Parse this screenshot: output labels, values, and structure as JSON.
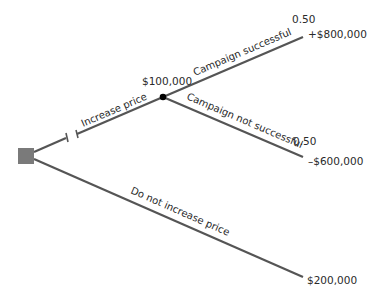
{
  "diagram": {
    "type": "decision-tree",
    "colors": {
      "branch": "#555555",
      "decision_node": "#7a7a7a",
      "chance_node": "#000000"
    },
    "decision_node": {
      "shape": "square"
    },
    "branches": {
      "increase_price": {
        "label": "Increase price",
        "expected_value": "$100,000"
      },
      "do_not_increase": {
        "label": "Do not increase price",
        "payoff": "$200,000"
      },
      "campaign_successful": {
        "label": "Campaign successful",
        "probability": "0.50",
        "payoff": "+$800,000"
      },
      "campaign_not_successful": {
        "label": "Campaign not successful",
        "probability": "0.50",
        "payoff": "–$600,000"
      }
    }
  }
}
